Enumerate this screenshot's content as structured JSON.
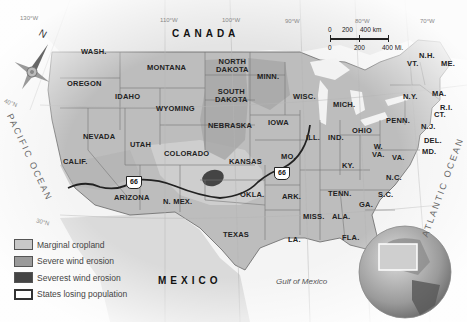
{
  "countries": {
    "canada": "CANADA",
    "mexico": "MEXICO"
  },
  "water": {
    "pacific": "PACIFIC OCEAN",
    "atlantic": "ATLANTIC OCEAN",
    "gulf": "Gulf of Mexico"
  },
  "states": {
    "wash": "WASH.",
    "oregon": "OREGON",
    "idaho": "IDAHO",
    "montana": "MONTANA",
    "wyoming": "WYOMING",
    "nevada": "NEVADA",
    "calif": "CALIF.",
    "utah": "UTAH",
    "colorado": "COLORADO",
    "arizona": "ARIZONA",
    "nmex": "N. MEX.",
    "ndakota_1": "NORTH",
    "ndakota_2": "DAKOTA",
    "sdakota_1": "SOUTH",
    "sdakota_2": "DAKOTA",
    "nebraska": "NEBRASKA",
    "kansas": "KANSAS",
    "okla": "OKLA.",
    "texas": "TEXAS",
    "minn": "MINN.",
    "iowa": "IOWA",
    "mo": "MO.",
    "ark": "ARK.",
    "la": "LA.",
    "wisc": "WISC.",
    "ill": "ILL.",
    "mich": "MICH.",
    "ind": "IND.",
    "ohio": "OHIO",
    "ky": "KY.",
    "tenn": "TENN.",
    "miss": "MISS.",
    "ala": "ALA.",
    "ga": "GA.",
    "fla": "FLA.",
    "sc": "S.C.",
    "nc": "N.C.",
    "va": "VA.",
    "wva_1": "W.",
    "wva_2": "VA.",
    "penn": "PENN.",
    "ny": "N.Y.",
    "vt": "VT.",
    "nh": "N.H.",
    "me": "ME.",
    "ma": "MA.",
    "ri": "R.I.",
    "ct": "CT.",
    "nj": "N.J.",
    "del": "DEL.",
    "md": "MD."
  },
  "route": {
    "shield_label": "66"
  },
  "coordinates": {
    "lon130": "130°W",
    "lon110": "110°W",
    "lon100": "100°W",
    "lon90": "90°W",
    "lon80": "80°W",
    "lon70": "70°W",
    "lat40": "40°N",
    "lat30": "30°N"
  },
  "compass": {
    "north": "N"
  },
  "scale": {
    "km_0": "0",
    "km_200": "200",
    "km_400": "400 km",
    "mi_0": "0",
    "mi_200": "200",
    "mi_400": "400 Mi."
  },
  "legend": [
    {
      "label": "Marginal cropland",
      "color": "#c8c8c8"
    },
    {
      "label": "Severe wind erosion",
      "color": "#9a9a9a"
    },
    {
      "label": "Severest wind erosion",
      "color": "#444444"
    },
    {
      "label": "States losing population",
      "color": "#ffffff"
    }
  ]
}
